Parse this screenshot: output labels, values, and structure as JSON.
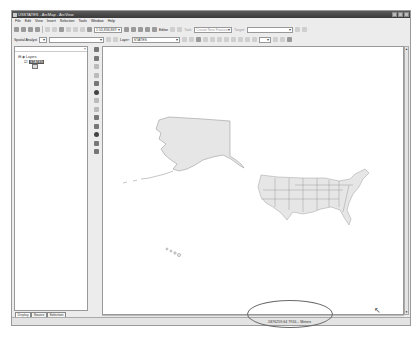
{
  "window": {
    "title": "USSTATES - ArcMap - ArcView",
    "controls": [
      "minimize",
      "maximize",
      "close"
    ]
  },
  "menubar": {
    "items": [
      "File",
      "Edit",
      "View",
      "Insert",
      "Selection",
      "Tools",
      "Window",
      "Help"
    ]
  },
  "toolbar1": {
    "scale_value": "1:53,836,869",
    "editor_label": "Editor",
    "task_placeholder": "Create New Feature",
    "target_label": "Target:"
  },
  "toolbar2": {
    "spatial_analyst_label": "Spatial Analyst",
    "layer_label": "Layer:",
    "layer_value": "STATES"
  },
  "toc": {
    "root_label": "Layers",
    "layer_name": "STATES",
    "tabs": [
      "Display",
      "Source",
      "Selection"
    ],
    "active_tab": "Display"
  },
  "map": {
    "features": [
      "Alaska",
      "Continental US states",
      "Hawaii"
    ],
    "fill_color": "#e6e6e6",
    "outline_color": "#8a8a8a"
  },
  "status": {
    "coordinates": "-5876259.64 7916... Meters",
    "annotation": "circled coordinate readout"
  },
  "colors": {
    "titlebar": "#4a4a4a",
    "chrome": "#ececec",
    "ellipse": "#6a6a6a"
  }
}
